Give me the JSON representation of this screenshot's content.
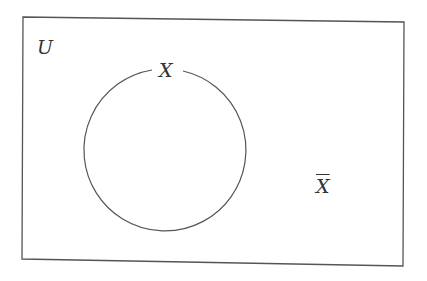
{
  "diagram": {
    "type": "venn",
    "universe_label": "U",
    "set_label": "X",
    "complement_label": "X",
    "complement_marker": "overline",
    "stroke_color": "#555555",
    "background": "#ffffff"
  }
}
